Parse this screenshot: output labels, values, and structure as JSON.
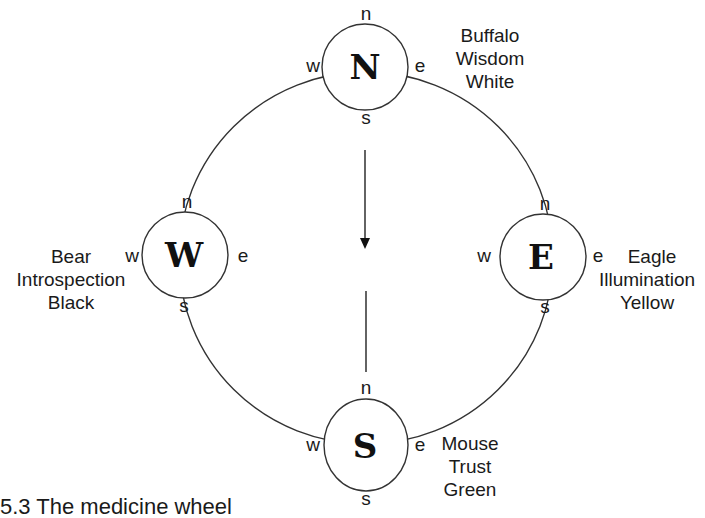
{
  "diagram": {
    "title": "The medicine wheel",
    "flow_direction": "north-to-south",
    "stations": [
      {
        "position": "north",
        "glyph": "N",
        "directions": {
          "n": "n",
          "e": "e",
          "s": "s",
          "w": "w"
        },
        "lines": [
          "Buffalo",
          "Wisdom",
          "White"
        ]
      },
      {
        "position": "west",
        "glyph": "W",
        "directions": {
          "n": "n",
          "e": "e",
          "s": "s",
          "w": "w"
        },
        "lines": [
          "Bear",
          "Introspection",
          "Black"
        ]
      },
      {
        "position": "east",
        "glyph": "E",
        "directions": {
          "n": "n",
          "e": "e",
          "s": "s",
          "w": "w"
        },
        "lines": [
          "Eagle",
          "Illumination",
          "Yellow"
        ]
      },
      {
        "position": "south",
        "glyph": "S",
        "directions": {
          "n": "n",
          "e": "e",
          "s": "s",
          "w": "w"
        },
        "lines": [
          "Mouse",
          "Trust",
          "Green"
        ]
      }
    ]
  },
  "caption": {
    "text": "5.3    The medicine wheel"
  },
  "colors": {
    "stroke": "#333333",
    "text": "#1a1a1a",
    "background": "#ffffff"
  }
}
